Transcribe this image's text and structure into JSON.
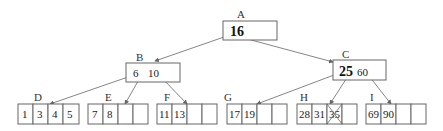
{
  "diagram": {
    "type": "b-tree",
    "root": {
      "label": "A",
      "keys": [
        "16"
      ]
    },
    "internal": [
      {
        "label": "B",
        "keys": [
          "6",
          "10"
        ]
      },
      {
        "label": "C",
        "keys": [
          "25",
          "60"
        ]
      }
    ],
    "leaves": [
      {
        "label": "D",
        "cells": [
          "1",
          "3",
          "4",
          "5"
        ]
      },
      {
        "label": "E",
        "cells": [
          "7",
          "8",
          "",
          ""
        ]
      },
      {
        "label": "F",
        "cells": [
          "11",
          "13",
          "",
          ""
        ]
      },
      {
        "label": "G",
        "cells": [
          "17",
          "19",
          "",
          ""
        ]
      },
      {
        "label": "H",
        "cells": [
          "28",
          "31",
          "35",
          ""
        ],
        "crossed_out": "35"
      },
      {
        "label": "I",
        "cells": [
          "69",
          "90",
          "",
          ""
        ]
      }
    ],
    "colors": {
      "stroke": "#666666",
      "text": "#222222",
      "background": "#ffffff"
    }
  }
}
